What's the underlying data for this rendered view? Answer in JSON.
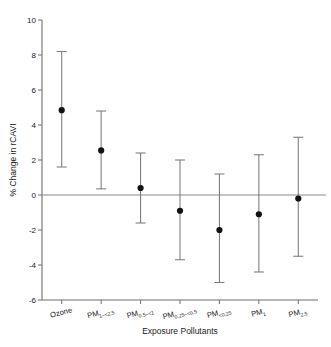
{
  "chart_data": {
    "type": "scatter",
    "title": "",
    "xlabel": "Exposure Pollutants",
    "ylabel": "% Change in rCAVI",
    "ylim": [
      -6,
      10
    ],
    "yticks": [
      10,
      8,
      6,
      4,
      2,
      0,
      -2,
      -4,
      -6
    ],
    "ytick_labels": [
      "10",
      "8",
      "6",
      "4",
      "2",
      "0",
      "-2",
      "-4",
      "-6"
    ],
    "grid": false,
    "legend": "none",
    "zero_reference_line": 0,
    "error_bar_type": "95% confidence interval",
    "categories": [
      "Ozone",
      "PM1–<2.5",
      "PM0.5–<1",
      "PM0.25–<0.5",
      "PM<0.25",
      "PM1",
      "PM2.5"
    ],
    "category_parts": [
      {
        "base": "Ozone",
        "sub": ""
      },
      {
        "base": "PM",
        "sub": "1–<2.5"
      },
      {
        "base": "PM",
        "sub": "0.5–<1"
      },
      {
        "base": "PM",
        "sub": "0.25–<0.5"
      },
      {
        "base": "PM",
        "sub": "<0.25"
      },
      {
        "base": "PM",
        "sub": "1"
      },
      {
        "base": "PM",
        "sub": "2.5"
      }
    ],
    "values": [
      4.85,
      2.55,
      0.4,
      -0.9,
      -2.0,
      -1.1,
      -0.2
    ],
    "ci_low": [
      1.6,
      0.35,
      -1.6,
      -3.7,
      -5.0,
      -4.4,
      -3.5
    ],
    "ci_high": [
      8.2,
      4.8,
      2.4,
      2.0,
      1.2,
      2.3,
      3.3
    ],
    "point_color": "#121212",
    "error_bar_color": "#7a7a7a",
    "axis_color": "#6e6e6e"
  },
  "figure": {
    "plot_left": 42,
    "plot_right": 318,
    "plot_top": 20,
    "plot_bottom": 300
  }
}
